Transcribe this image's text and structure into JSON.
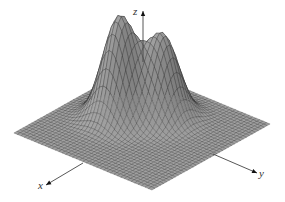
{
  "chart_data": {
    "type": "surface",
    "title": "",
    "xlabel": "x",
    "ylabel": "y",
    "zlabel": "z",
    "domain": {
      "x": [
        -3,
        3
      ],
      "y": [
        -3,
        3
      ]
    },
    "grid_resolution": 40,
    "peaks": [
      {
        "x": 0.0,
        "y": -1.0,
        "height": 1.0,
        "width": 0.62
      },
      {
        "x": -1.0,
        "y": 0.05,
        "height": 0.81,
        "width": 0.62
      }
    ],
    "grid": false,
    "legend": null,
    "colors": {
      "surface": "#8c8c8c",
      "mesh": "#222222",
      "axis": "#444444"
    }
  },
  "axes": {
    "x_label": "x",
    "y_label": "y",
    "z_label": "z"
  }
}
